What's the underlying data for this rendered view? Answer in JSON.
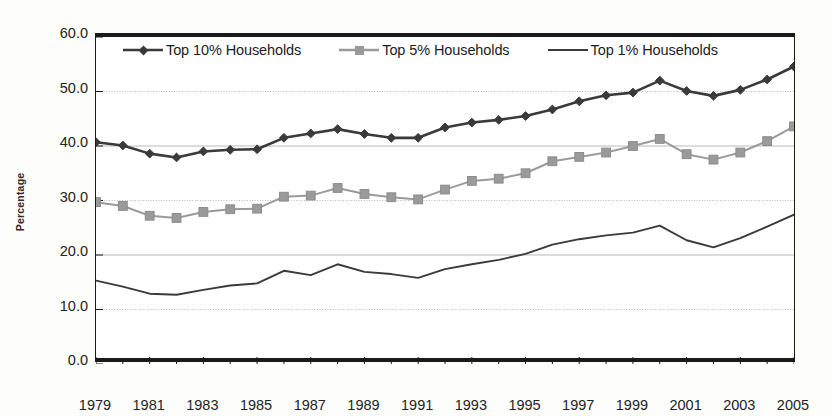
{
  "chart_data": {
    "type": "line",
    "title": "",
    "subtitle": "",
    "xlabel": "",
    "ylabel": "Percentage",
    "x": [
      1979,
      1980,
      1981,
      1982,
      1983,
      1984,
      1985,
      1986,
      1987,
      1988,
      1989,
      1990,
      1991,
      1992,
      1993,
      1994,
      1995,
      1996,
      1997,
      1998,
      1999,
      2000,
      2001,
      2002,
      2003,
      2004,
      2005
    ],
    "xlim": [
      1979,
      2005
    ],
    "ylim": [
      0.0,
      60.0
    ],
    "yticks": [
      "0.0",
      "10.0",
      "20.0",
      "30.0",
      "40.0",
      "50.0",
      "60.0"
    ],
    "ytick_values": [
      0.0,
      10.0,
      20.0,
      30.0,
      40.0,
      50.0,
      60.0
    ],
    "xticks": [
      "1979",
      "1981",
      "1983",
      "1985",
      "1987",
      "1989",
      "1991",
      "1993",
      "1995",
      "1997",
      "1999",
      "2001",
      "2003",
      "2005"
    ],
    "xtick_values": [
      1979,
      1981,
      1983,
      1985,
      1987,
      1989,
      1991,
      1993,
      1995,
      1997,
      1999,
      2001,
      2003,
      2005
    ],
    "xtick_minor_values": [
      1980,
      1982,
      1984,
      1986,
      1988,
      1990,
      1992,
      1994,
      1996,
      1998,
      2000,
      2002,
      2004
    ],
    "grid": true,
    "grid_axis": "y",
    "legend_position": "top-inside",
    "series": [
      {
        "name": "Top 10% Households",
        "marker": "diamond",
        "color": "#3a3a3a",
        "values": [
          40.7,
          40.1,
          38.6,
          37.9,
          39.0,
          39.3,
          39.4,
          41.5,
          42.3,
          43.1,
          42.2,
          41.5,
          41.5,
          43.4,
          44.3,
          44.8,
          45.5,
          46.7,
          48.2,
          49.3,
          49.8,
          52.0,
          50.1,
          49.2,
          50.3,
          52.2,
          54.6
        ],
        "ylim_note": "percent of total income"
      },
      {
        "name": "Top 5% Households",
        "marker": "square",
        "color": "#9a9a9a",
        "values": [
          29.7,
          29.0,
          27.2,
          26.8,
          27.9,
          28.4,
          28.5,
          30.7,
          30.9,
          32.3,
          31.2,
          30.6,
          30.2,
          32.0,
          33.6,
          34.0,
          35.0,
          37.2,
          38.0,
          38.8,
          40.0,
          41.3,
          38.5,
          37.5,
          38.8,
          40.9,
          43.6
        ]
      },
      {
        "name": "Top 1% Households",
        "marker": "none",
        "color": "#3a3a3a",
        "values": [
          15.3,
          14.2,
          12.9,
          12.7,
          13.6,
          14.4,
          14.8,
          17.1,
          16.3,
          18.3,
          16.9,
          16.5,
          15.8,
          17.4,
          18.3,
          19.1,
          20.2,
          21.9,
          22.9,
          23.6,
          24.1,
          25.4,
          22.7,
          21.4,
          23.1,
          25.2,
          27.4
        ]
      }
    ]
  },
  "legend": {
    "items": [
      {
        "label": "Top 10% Households",
        "key": "diamond-marker-key"
      },
      {
        "label": "Top 5% Households",
        "key": "square-marker-key"
      },
      {
        "label": "Top 1% Households",
        "key": "plain-line-key"
      }
    ]
  },
  "axes": {
    "y_title": "Percentage"
  },
  "colors": {
    "series_top10": "#3a3a3a",
    "series_top5": "#9a9a9a",
    "series_top1": "#3a3a3a",
    "axis": "#1a1a1a",
    "grid": "#b9b9b9",
    "background": "#ffffff"
  }
}
